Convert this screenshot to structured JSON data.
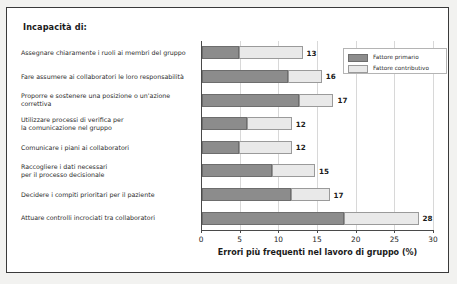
{
  "chart": {
    "title": "Incapacità di:",
    "frame_border_color": "#3a3a3a",
    "outer_background": "#f2f2f0"
  },
  "legend": {
    "position": "top-right",
    "entries": [
      {
        "label": "Fattore primario",
        "color": "#8c8c8c"
      },
      {
        "label": "Fattore contributivo",
        "color": "#e9e9e9"
      }
    ]
  },
  "chart_data": {
    "type": "bar",
    "orientation": "horizontal",
    "stacked": true,
    "title": "Incapacità di:",
    "xlabel": "Errori più frequenti nel lavoro di gruppo (%)",
    "ylabel": "",
    "xlim": [
      0,
      30
    ],
    "xticks": [
      0,
      5,
      10,
      15,
      20,
      25,
      30
    ],
    "grid": true,
    "legend": [
      "Fattore primario",
      "Fattore contributivo"
    ],
    "categories": [
      "Assegnare chiaramente i ruoli ai membri del gruppo",
      "Fare assumere ai collaboratori le loro responsabilità",
      "Proporre e sostenere una posizione o un'azione correttiva",
      "Utilizzare processi di verifica per la comunicazione nel gruppo",
      "Comunicare i piani ai collaboratori",
      "Raccogliere i dati necessari per il processo decisionale",
      "Decidere i compiti prioritari per il paziente",
      "Attuare controlli incrociati tra collaboratori"
    ],
    "series": [
      {
        "name": "Fattore primario",
        "values": [
          4.8,
          11.1,
          12.6,
          5.8,
          4.8,
          9.0,
          11.5,
          18.3
        ]
      },
      {
        "name": "Fattore contributivo",
        "values": [
          8.2,
          4.4,
          4.4,
          5.8,
          6.8,
          5.6,
          5.0,
          9.7
        ]
      }
    ],
    "totals": [
      13,
      16,
      17,
      12,
      12,
      15,
      17,
      28
    ],
    "value_labels": [
      "13",
      "16",
      "17",
      "12",
      "12",
      "15",
      "17",
      "28"
    ]
  },
  "rows": [
    {
      "label_lines": [
        "Assegnare chiaramente i ruoli ai membri del gruppo"
      ],
      "primary": 4.8,
      "contributive": 8.2,
      "total_label": "13"
    },
    {
      "label_lines": [
        "Fare assumere ai collaboratori le loro responsabilità"
      ],
      "primary": 11.1,
      "contributive": 4.4,
      "total_label": "16"
    },
    {
      "label_lines": [
        "Proporre e sostenere una posizione o un'azione",
        "correttiva"
      ],
      "primary": 12.6,
      "contributive": 4.4,
      "total_label": "17"
    },
    {
      "label_lines": [
        "Utilizzare processi di verifica per",
        "la comunicazione nel gruppo"
      ],
      "primary": 5.8,
      "contributive": 5.8,
      "total_label": "12"
    },
    {
      "label_lines": [
        "Comunicare i piani ai collaboratori"
      ],
      "primary": 4.8,
      "contributive": 6.8,
      "total_label": "12"
    },
    {
      "label_lines": [
        "Raccogliere i dati necessari",
        "per il processo decisionale"
      ],
      "primary": 9.0,
      "contributive": 5.6,
      "total_label": "15"
    },
    {
      "label_lines": [
        "Decidere i compiti prioritari per il paziente"
      ],
      "primary": 11.5,
      "contributive": 5.0,
      "total_label": "17"
    },
    {
      "label_lines": [
        "Attuare controlli incrociati tra collaboratori"
      ],
      "primary": 18.3,
      "contributive": 9.7,
      "total_label": "28"
    }
  ],
  "xaxis": {
    "title": "Errori più frequenti nel lavoro di gruppo (%)",
    "ticks": [
      "0",
      "5",
      "10",
      "15",
      "20",
      "25",
      "30"
    ]
  }
}
